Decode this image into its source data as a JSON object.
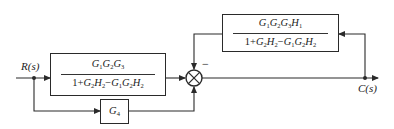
{
  "diagram": {
    "type": "control-system block diagram",
    "input": {
      "label": "R(s)"
    },
    "output": {
      "label": "C(s)"
    },
    "blocks": [
      {
        "id": "forward",
        "numerator": "G1G2G3",
        "denominator": "1+G2H2−G1G2H2",
        "numerator_parts": [
          [
            "G",
            "1"
          ],
          [
            "G",
            "2"
          ],
          [
            "G",
            "3"
          ]
        ],
        "denominator_parts": {
          "lead": "1+",
          "terms": [
            [
              [
                "G",
                "2"
              ],
              [
                "H",
                "2"
              ]
            ],
            "−",
            [
              [
                "G",
                "1"
              ],
              [
                "G",
                "2"
              ],
              [
                "H",
                "2"
              ]
            ]
          ]
        }
      },
      {
        "id": "feedback",
        "numerator": "G1G2G3H1",
        "denominator": "1+G2H2−G1G2H2"
      },
      {
        "id": "feedforward",
        "label": "G4"
      }
    ],
    "summing_junction": {
      "inputs": [
        {
          "from": "forward",
          "sign": "+"
        },
        {
          "from": "feedback",
          "sign": "−"
        },
        {
          "from": "feedforward",
          "sign": "+"
        }
      ],
      "visible_sign": "−"
    },
    "connections": [
      "R(s) → branch → forward block → summing junction",
      "R(s) branch → G4 → summing junction (bottom)",
      "summing junction → C(s)",
      "C(s) branch → feedback block → summing junction (top, negative)"
    ]
  }
}
